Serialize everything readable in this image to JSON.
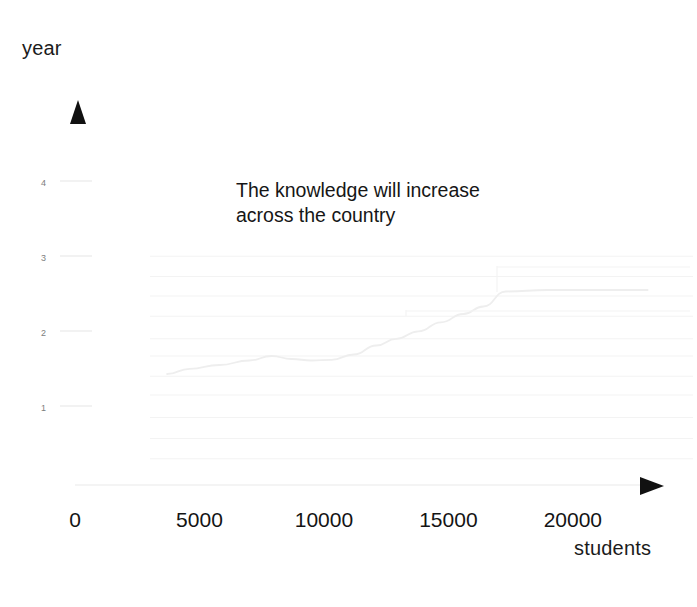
{
  "chart_data": {
    "type": "line",
    "title": "The knowledge will  increase\n across the country",
    "xlabel": "students",
    "ylabel": "year",
    "xlim": [
      0,
      23500
    ],
    "ylim": [
      0,
      4.6
    ],
    "grid": true,
    "legend": null,
    "x_ticks": [
      {
        "label": "0",
        "value": 0
      },
      {
        "label": "5000",
        "value": 5000
      },
      {
        "label": "10000",
        "value": 10000
      },
      {
        "label": "15000",
        "value": 15000
      },
      {
        "label": "20000",
        "value": 20000
      }
    ],
    "y_ticks": [
      {
        "label": "1",
        "value": 1
      },
      {
        "label": "2",
        "value": 2
      },
      {
        "label": "3",
        "value": 3
      },
      {
        "label": "4",
        "value": 4
      }
    ],
    "series": [
      {
        "name": "knowledge growth",
        "color": "#eeeeee",
        "x": [
          3700,
          4600,
          5800,
          7000,
          7900,
          8700,
          9500,
          10300,
          11200,
          12100,
          12900,
          13800,
          14700,
          15600,
          16400,
          17300,
          19000,
          21000,
          23000
        ],
        "y": [
          1.48,
          1.55,
          1.6,
          1.66,
          1.72,
          1.68,
          1.66,
          1.67,
          1.74,
          1.86,
          1.95,
          2.05,
          2.17,
          2.28,
          2.38,
          2.58,
          2.6,
          2.6,
          2.6
        ]
      }
    ],
    "gridlines_y": [
      0.35,
      0.62,
      0.9,
      1.2,
      1.45,
      1.72,
      1.95,
      2.25,
      2.52,
      2.78,
      3.05
    ],
    "axis_arrows": {
      "y": "up-triangle",
      "x": "right-triangle"
    }
  },
  "labels": {
    "y_axis_title": "year",
    "x_axis_title": "students",
    "title": "The knowledge will  increase\n across the country"
  },
  "colors": {
    "ink": "#161616",
    "series": "#eeeeee",
    "grid": "#f3f3f3",
    "axis": "#f0f0f0",
    "arrow": "#111111",
    "tick_y": "#7d7d7d"
  }
}
